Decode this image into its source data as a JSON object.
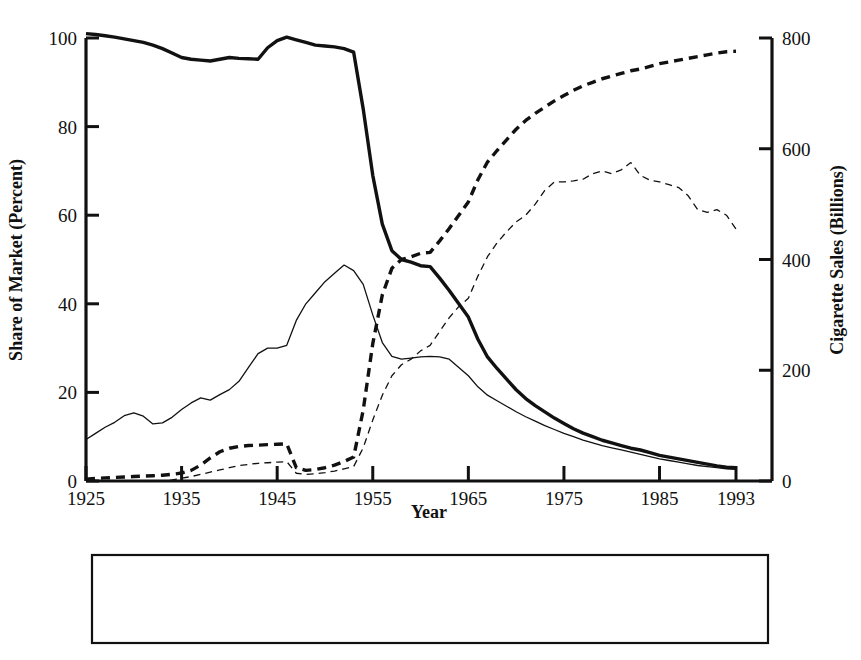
{
  "chart_data": {
    "type": "line",
    "title": "",
    "xlabel": "Year",
    "ylabel": "Share of Market (Percent)",
    "y2label": "Cigarette Sales (Billions)",
    "xlim": [
      1925,
      1993
    ],
    "ylim": [
      0,
      100
    ],
    "y2lim": [
      0,
      800
    ],
    "grid": false,
    "legend_position": "bottom",
    "x_ticks": [
      "1925",
      "1935",
      "1945",
      "1955",
      "1965",
      "1975",
      "1985",
      "1993"
    ],
    "x_tick_values": [
      1925,
      1935,
      1945,
      1955,
      1965,
      1975,
      1985,
      1993
    ],
    "y_ticks": [
      "0",
      "20",
      "40",
      "60",
      "80",
      "100"
    ],
    "y_tick_values": [
      0,
      20,
      40,
      60,
      80,
      100
    ],
    "y2_ticks": [
      "0",
      "200",
      "400",
      "600",
      "800"
    ],
    "y2_tick_values": [
      0,
      200,
      400,
      600,
      800
    ],
    "x": [
      1925,
      1926,
      1927,
      1928,
      1929,
      1930,
      1931,
      1932,
      1933,
      1934,
      1935,
      1936,
      1937,
      1938,
      1939,
      1940,
      1941,
      1942,
      1943,
      1944,
      1945,
      1946,
      1947,
      1948,
      1949,
      1950,
      1951,
      1952,
      1953,
      1954,
      1955,
      1956,
      1957,
      1958,
      1959,
      1960,
      1961,
      1962,
      1963,
      1964,
      1965,
      1966,
      1967,
      1968,
      1969,
      1970,
      1971,
      1972,
      1973,
      1974,
      1975,
      1976,
      1977,
      1978,
      1979,
      1980,
      1981,
      1982,
      1983,
      1984,
      1985,
      1986,
      1987,
      1988,
      1989,
      1990,
      1991,
      1992,
      1993
    ],
    "series": [
      {
        "name": "Non-Filter Market Share",
        "axis": "left",
        "unit": "percent",
        "style": "solid-thick",
        "values": [
          101,
          100.8,
          100.5,
          100.2,
          99.8,
          99.4,
          99.0,
          98.4,
          97.6,
          96.6,
          95.6,
          95.2,
          95.0,
          94.8,
          95.2,
          95.6,
          95.4,
          95.3,
          95.2,
          97.8,
          99.4,
          100.2,
          99.6,
          99.0,
          98.4,
          98.2,
          98.0,
          97.6,
          96.8,
          84.0,
          69.0,
          58.0,
          52.0,
          50.0,
          49.4,
          48.6,
          48.4,
          45.8,
          43.0,
          40.0,
          37.0,
          32.0,
          28.0,
          25.4,
          23.0,
          20.6,
          18.6,
          17.0,
          15.6,
          14.2,
          13.0,
          11.8,
          10.8,
          10.0,
          9.2,
          8.6,
          8.0,
          7.4,
          7.0,
          6.4,
          5.8,
          5.4,
          5.0,
          4.6,
          4.2,
          3.8,
          3.4,
          3.1,
          3.0
        ]
      },
      {
        "name": "Filter Market Share",
        "axis": "left",
        "unit": "percent",
        "style": "dashed-thick",
        "values": [
          0.4,
          0.6,
          0.7,
          0.8,
          0.9,
          1.0,
          1.1,
          1.2,
          1.3,
          1.5,
          1.8,
          2.4,
          3.6,
          5.2,
          6.6,
          7.4,
          7.8,
          8.0,
          8.1,
          8.2,
          8.3,
          8.4,
          3.0,
          2.4,
          2.6,
          3.0,
          3.6,
          4.4,
          5.4,
          16.0,
          31.0,
          42.0,
          48.0,
          50.0,
          50.6,
          51.4,
          51.6,
          54.2,
          57.0,
          60.0,
          63.0,
          68.0,
          72.0,
          74.6,
          77.0,
          79.4,
          81.4,
          83.0,
          84.4,
          85.8,
          87.0,
          88.2,
          89.2,
          90.0,
          90.8,
          91.4,
          92.0,
          92.6,
          93.0,
          93.6,
          94.2,
          94.6,
          95.0,
          95.4,
          95.8,
          96.2,
          96.6,
          96.9,
          97.0
        ]
      },
      {
        "name": "Non-Filter Cigarette Sales",
        "axis": "right",
        "unit": "billions",
        "style": "solid-thin",
        "values": [
          75,
          86,
          97,
          106,
          118,
          123,
          117,
          103,
          105,
          115,
          129,
          141,
          150,
          146,
          156,
          165,
          180,
          205,
          230,
          240,
          240,
          245,
          290,
          320,
          340,
          360,
          375,
          390,
          380,
          355,
          300,
          250,
          225,
          220,
          222,
          224,
          225,
          224,
          220,
          205,
          190,
          170,
          155,
          145,
          135,
          125,
          116,
          108,
          100,
          93,
          86,
          80,
          74,
          69,
          64,
          60,
          56,
          52,
          48,
          44,
          40,
          37,
          34,
          31,
          28,
          26,
          24,
          22,
          21
        ]
      },
      {
        "name": "Filter Cigarette Sales",
        "axis": "right",
        "unit": "billions",
        "style": "dashed-thin",
        "values": [
          0,
          0,
          0,
          0,
          0,
          0,
          0,
          0,
          0,
          2,
          5,
          8,
          12,
          16,
          20,
          24,
          28,
          30,
          32,
          33,
          34,
          35,
          14,
          12,
          13,
          15,
          18,
          22,
          26,
          60,
          110,
          155,
          190,
          210,
          220,
          235,
          245,
          270,
          295,
          315,
          330,
          370,
          405,
          430,
          450,
          468,
          480,
          500,
          525,
          540,
          540,
          542,
          545,
          555,
          560,
          555,
          562,
          575,
          552,
          543,
          540,
          535,
          530,
          515,
          490,
          485,
          490,
          480,
          455
        ]
      }
    ]
  },
  "legend": {
    "entries": [
      {
        "label": "Non-Filter Market Share",
        "style": "solid-thick"
      },
      {
        "label": "Filter Market Share",
        "style": "dashed-thick"
      },
      {
        "label": "Non-Filter Cigarette Sales",
        "style": "solid-thin"
      },
      {
        "label": "Filter Cigarette Sales",
        "style": "dashed-thin"
      }
    ]
  }
}
